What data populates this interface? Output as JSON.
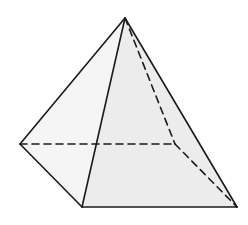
{
  "diagram": {
    "type": "square-pyramid",
    "colors": {
      "background": "#ffffff",
      "left_face": "#f5f5f5",
      "right_face": "#ececec",
      "edge": "#1a1a1a"
    },
    "vertices": {
      "apex": [
        125,
        18
      ],
      "left": [
        20,
        144
      ],
      "front": [
        82,
        207
      ],
      "right": [
        237,
        207
      ],
      "back_hidden": [
        175,
        144
      ]
    },
    "edges_visible": [
      [
        "apex",
        "left"
      ],
      [
        "apex",
        "front"
      ],
      [
        "apex",
        "right"
      ],
      [
        "left",
        "front"
      ],
      [
        "front",
        "right"
      ]
    ],
    "edges_hidden": [
      [
        "apex",
        "back_hidden"
      ],
      [
        "left",
        "back_hidden"
      ],
      [
        "back_hidden",
        "right"
      ]
    ]
  }
}
